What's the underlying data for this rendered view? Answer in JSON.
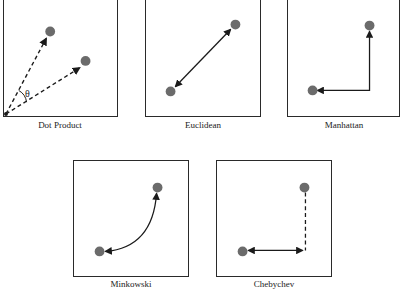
{
  "diagram": {
    "title": "",
    "colors": {
      "point": "#6b6b6b",
      "line": "#1a1a1a",
      "border": "#2a2a2a"
    },
    "panels": [
      {
        "id": "dot-product",
        "label": "Dot Product",
        "annotation": "θ",
        "line_style": "dashed arrows from origin"
      },
      {
        "id": "euclidean",
        "label": "Euclidean",
        "line_style": "solid double-headed straight line"
      },
      {
        "id": "manhattan",
        "label": "Manhattan",
        "line_style": "solid right-angle path"
      },
      {
        "id": "minkowski",
        "label": "Minkowski",
        "line_style": "solid curved path"
      },
      {
        "id": "chebychev",
        "label": "Chebychev",
        "line_style": "solid horizontal arrow plus dashed vertical"
      }
    ]
  }
}
